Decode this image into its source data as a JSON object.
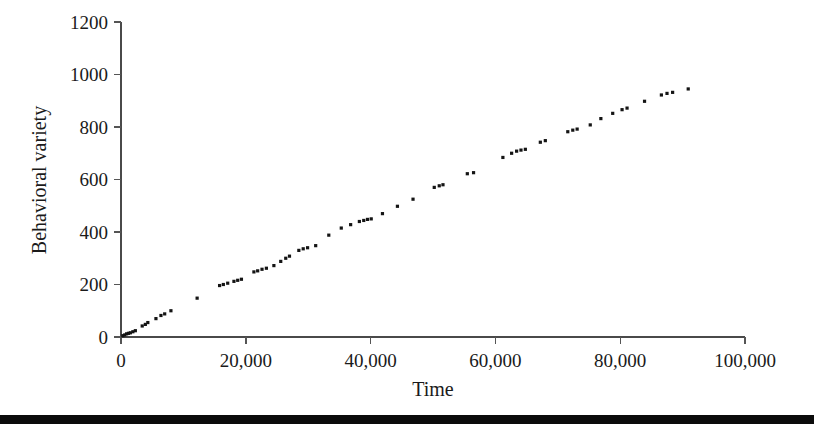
{
  "figure": {
    "width": 814,
    "height": 428,
    "background_color": "#ffffff",
    "marker_color": "#141414",
    "axis_color": "#4a4a4a",
    "bottom_rule_color": "#0b0b0b"
  },
  "chart_data": {
    "type": "scatter",
    "title": "",
    "xlabel": "Time",
    "ylabel": "Behavioral variety",
    "xlim": [
      0,
      100000
    ],
    "ylim": [
      0,
      1200
    ],
    "xticks": [
      0,
      20000,
      40000,
      60000,
      80000,
      100000
    ],
    "xticklabels": [
      "0",
      "20,000",
      "40,000",
      "60,000",
      "80,000",
      "100,000"
    ],
    "yticks": [
      0,
      200,
      400,
      600,
      800,
      1000,
      1200
    ],
    "yticklabels": [
      "0",
      "200",
      "400",
      "600",
      "800",
      "1000",
      "1200"
    ],
    "grid": false,
    "legend": false,
    "marker": "square",
    "marker_size_px": 3.2,
    "series": [
      {
        "name": "Behavioral variety over time",
        "points": [
          [
            300,
            5
          ],
          [
            600,
            8
          ],
          [
            900,
            12
          ],
          [
            1200,
            14
          ],
          [
            1500,
            16
          ],
          [
            1900,
            20
          ],
          [
            2300,
            24
          ],
          [
            3400,
            42
          ],
          [
            3900,
            48
          ],
          [
            4300,
            55
          ],
          [
            5600,
            70
          ],
          [
            6400,
            82
          ],
          [
            7000,
            88
          ],
          [
            8000,
            100
          ],
          [
            12200,
            148
          ],
          [
            15800,
            196
          ],
          [
            16400,
            200
          ],
          [
            17100,
            205
          ],
          [
            18100,
            212
          ],
          [
            18700,
            216
          ],
          [
            19300,
            220
          ],
          [
            21300,
            248
          ],
          [
            21900,
            252
          ],
          [
            22600,
            258
          ],
          [
            23300,
            262
          ],
          [
            24500,
            272
          ],
          [
            25600,
            288
          ],
          [
            26400,
            300
          ],
          [
            27000,
            308
          ],
          [
            28500,
            330
          ],
          [
            29200,
            336
          ],
          [
            29900,
            340
          ],
          [
            31200,
            348
          ],
          [
            33300,
            388
          ],
          [
            35300,
            415
          ],
          [
            36800,
            428
          ],
          [
            38200,
            440
          ],
          [
            38900,
            444
          ],
          [
            39500,
            448
          ],
          [
            40100,
            450
          ],
          [
            41900,
            470
          ],
          [
            44300,
            498
          ],
          [
            46800,
            525
          ],
          [
            50200,
            570
          ],
          [
            51000,
            576
          ],
          [
            51600,
            580
          ],
          [
            55500,
            622
          ],
          [
            56500,
            626
          ],
          [
            61200,
            684
          ],
          [
            62600,
            700
          ],
          [
            63400,
            708
          ],
          [
            64100,
            712
          ],
          [
            64800,
            715
          ],
          [
            67200,
            742
          ],
          [
            68000,
            748
          ],
          [
            71600,
            782
          ],
          [
            72400,
            788
          ],
          [
            73100,
            792
          ],
          [
            75200,
            808
          ],
          [
            76900,
            832
          ],
          [
            78800,
            852
          ],
          [
            80300,
            866
          ],
          [
            81100,
            872
          ],
          [
            83900,
            898
          ],
          [
            86600,
            922
          ],
          [
            87500,
            928
          ],
          [
            88400,
            932
          ],
          [
            90900,
            945
          ]
        ]
      }
    ]
  },
  "axes": {
    "y_title": "Behavioral variety",
    "x_title": "Time"
  }
}
